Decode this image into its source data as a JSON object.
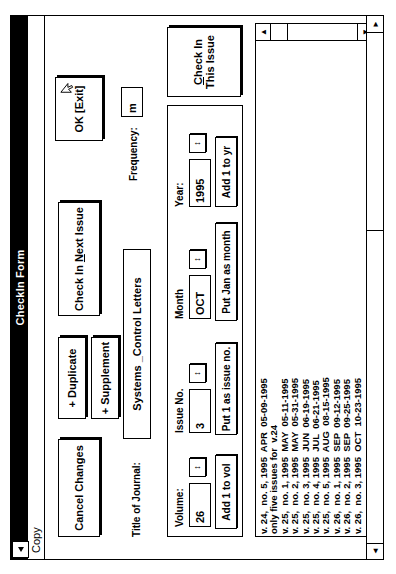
{
  "window": {
    "title": "CheckIn Form",
    "system_menu_icon": "system-menu-icon"
  },
  "menubar": {
    "items": [
      {
        "label": "Copy"
      }
    ]
  },
  "buttons": {
    "cancel_changes": "Cancel Changes",
    "duplicate": "+ Duplicate",
    "supplement": "+ Supplement",
    "check_in_next_issue": "Check In Next Issue",
    "check_in_next_issue_pre": "Check In ",
    "check_in_next_issue_accel": "N",
    "check_in_next_issue_post": "ext Issue",
    "ok_exit": "OK [Exit]",
    "add_1_to_vol": "Add 1 to vol",
    "put_1_as_issue_no": "Put 1 as issue no.",
    "put_jan_as_month": "Put Jan as month",
    "add_1_to_yr": "Add 1 to yr",
    "check_in_this_issue": "Check In This Issue",
    "check_in_this_issue_accel": "C",
    "check_in_this_issue_post": "heck In This Issue"
  },
  "fields": {
    "title_of_journal": {
      "label": "Title of Journal:",
      "value": "Systems _Control Letters"
    },
    "frequency": {
      "label": "Frequency:",
      "value": "m"
    },
    "volume": {
      "label": "Volume:",
      "value": "26"
    },
    "issue_no": {
      "label": "Issue No.",
      "value": "3"
    },
    "month": {
      "label": "Month",
      "value": "OCT"
    },
    "year": {
      "label": "Year:",
      "value": "1995"
    }
  },
  "spinners": {
    "glyph": "↕"
  },
  "holdings_list": {
    "rows": [
      "v. 24,  no. 5, 1995  APR  05-09-1995",
      "only five issues for  v.24",
      "v. 25,  no. 1, 1995  MAY  05-11-1995",
      "v. 25,  no. 2, 1995  MAY  05-31-1995",
      "v. 25,  no. 3, 1995  JUN  06-19-1995",
      "v. 25,  no. 4, 1995  JUL  06-21-1995",
      "v. 25,  no. 5, 1995  AUG  08-15-1995",
      "v. 26,  no. 1, 1995  SEP  09-12-1995",
      "v. 26,  no. 2, 1995  SEP  09-25-1995",
      "v. 26,  no. 3, 1995  OCT  10-23-1995"
    ]
  },
  "scrollbars": {
    "left_arrow": "◄",
    "right_arrow": "►",
    "up_arrow": "▲",
    "down_arrow": "▼"
  },
  "colors": {
    "titlebar_bg": "#000000",
    "titlebar_fg": "#ffffff",
    "window_bg": "#ffffff",
    "border": "#000000"
  }
}
